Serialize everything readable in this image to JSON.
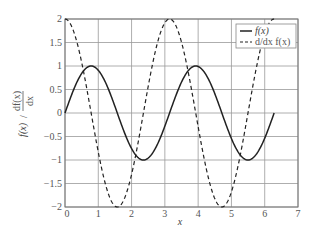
{
  "chart_data": {
    "type": "line",
    "title": "",
    "xlabel": "x",
    "ylabel": "f(x) / df(x)/dx",
    "xlim": [
      0,
      7
    ],
    "ylim": [
      -2,
      2
    ],
    "x_ticks": [
      "0",
      "1",
      "2",
      "3",
      "4",
      "5",
      "6",
      "7"
    ],
    "y_ticks": [
      "2",
      "1.5",
      "1",
      "0.5",
      "0",
      "-0.5",
      "-1",
      "-1.5",
      "-2"
    ],
    "grid": true,
    "legend_position": "upper right",
    "series": [
      {
        "name": "f(x)",
        "style": "solid",
        "function": "sin(2x)",
        "x_range": [
          0,
          6.283
        ],
        "points": [
          [
            0,
            0
          ],
          [
            0.785,
            1
          ],
          [
            1.571,
            0
          ],
          [
            2.356,
            -1
          ],
          [
            3.142,
            0
          ],
          [
            3.927,
            1
          ],
          [
            4.712,
            0
          ],
          [
            5.498,
            -1
          ],
          [
            6.283,
            0
          ]
        ]
      },
      {
        "name": "d/dx f(x)",
        "style": "dashed",
        "function": "2cos(2x)",
        "x_range": [
          0,
          6.283
        ],
        "points": [
          [
            0,
            2
          ],
          [
            0.785,
            0
          ],
          [
            1.571,
            -2
          ],
          [
            2.356,
            0
          ],
          [
            3.142,
            2
          ],
          [
            3.927,
            0
          ],
          [
            4.712,
            -2
          ],
          [
            5.498,
            0
          ],
          [
            6.283,
            2
          ]
        ]
      }
    ]
  },
  "legend": {
    "items": [
      {
        "label": "f(x)"
      },
      {
        "label": "d/dx f(x)"
      }
    ]
  },
  "axes": {
    "xlabel": "x",
    "ylabel_main": "f(x)",
    "ylabel_frac_num": "df(x)",
    "ylabel_frac_den": "dx"
  }
}
